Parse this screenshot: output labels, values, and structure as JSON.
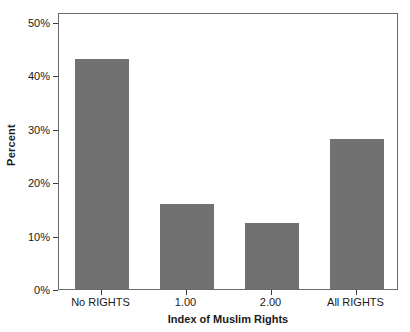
{
  "chart_data": {
    "type": "bar",
    "title": "",
    "xlabel": "Index of Muslim Rights",
    "ylabel": "Percent",
    "categories": [
      "No RIGHTS",
      "1.00",
      "2.00",
      "All RIGHTS"
    ],
    "values": [
      43,
      16,
      12.4,
      28
    ],
    "ylim": [
      0,
      50
    ],
    "ytick_labels": [
      "0%",
      "10%",
      "20%",
      "30%",
      "40%",
      "50%"
    ],
    "ytick_values": [
      0,
      10,
      20,
      30,
      40,
      50
    ],
    "grid": false,
    "legend": false,
    "bar_color": "#717171",
    "frame_color": "#6a6a6a",
    "background_color": "#ffffff"
  }
}
